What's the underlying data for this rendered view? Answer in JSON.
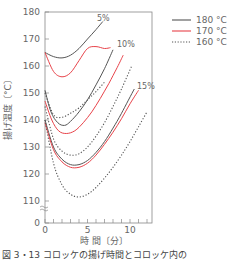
{
  "chart_data": {
    "type": "line",
    "title": "",
    "xlabel": "時 間〔分〕",
    "ylabel": "揚げ温度〔°C〕",
    "xlim": [
      0,
      12.5
    ],
    "ylim": [
      110,
      180
    ],
    "y_axis_break": true,
    "x_ticks": [
      0,
      5,
      10
    ],
    "y_ticks": [
      0,
      110,
      120,
      130,
      140,
      150,
      160,
      170,
      180
    ],
    "grid": false,
    "legend_position": "upper right, outside plot",
    "legend": [
      {
        "label": "180 °C",
        "color": "#555555",
        "style": "solid"
      },
      {
        "label": "170 °C",
        "color": "#e8434a",
        "style": "solid"
      },
      {
        "label": "160 °C",
        "color": "#555555",
        "style": "dotted"
      }
    ],
    "annotations": [
      "5%",
      "10%",
      "15%"
    ],
    "series": [
      {
        "name": "5% 180 °C",
        "group": "5%",
        "temp": "180 °C",
        "style": "solid",
        "color": "#555555",
        "x": [
          0,
          1,
          2,
          3,
          4,
          5,
          6,
          6.8
        ],
        "y": [
          165,
          163.5,
          163,
          164,
          166.5,
          170,
          173.5,
          176.5
        ]
      },
      {
        "name": "5% 170 °C",
        "group": "5%",
        "temp": "170 °C",
        "style": "solid",
        "color": "#e8434a",
        "x": [
          0,
          1,
          2,
          3,
          4,
          5,
          6,
          7,
          7.7
        ],
        "y": [
          165,
          158,
          156,
          157.5,
          162,
          166.5,
          167.2,
          166.5,
          166.8
        ]
      },
      {
        "name": "5% 160 °C",
        "group": "5%",
        "temp": "160 °C",
        "style": "dotted",
        "color": "#555555",
        "x": [
          0,
          1,
          2,
          3,
          4,
          5,
          6,
          7
        ],
        "y": [
          150,
          142,
          141,
          142.5,
          144.5,
          147.5,
          150.5,
          154
        ]
      },
      {
        "name": "10% 180 °C",
        "group": "10%",
        "temp": "180 °C",
        "style": "solid",
        "color": "#555555",
        "x": [
          0,
          0.7,
          1.5,
          2.3,
          3,
          4,
          5,
          6,
          7,
          8
        ],
        "y": [
          151,
          143,
          139,
          138,
          139.5,
          143,
          147.5,
          153,
          159,
          166
        ]
      },
      {
        "name": "10% 170 °C",
        "group": "10%",
        "temp": "170 °C",
        "style": "solid",
        "color": "#e8434a",
        "x": [
          0,
          0.8,
          1.6,
          2.5,
          3.5,
          4.5,
          5.5,
          6.5,
          7.5,
          8.5,
          9.2
        ],
        "y": [
          147,
          140,
          136,
          135,
          136,
          139,
          143,
          148,
          153.5,
          159.5,
          164
        ]
      },
      {
        "name": "10% 160 °C",
        "group": "10%",
        "temp": "160 °C",
        "style": "dotted",
        "color": "#555555",
        "x": [
          0,
          1,
          2,
          3,
          4,
          5,
          6,
          7,
          8,
          9,
          10.2
        ],
        "y": [
          145,
          133,
          128.5,
          127,
          127.5,
          130,
          134,
          139,
          145,
          151.5,
          160
        ]
      },
      {
        "name": "15% 180 °C",
        "group": "15%",
        "temp": "180 °C",
        "style": "solid",
        "color": "#555555",
        "x": [
          0,
          1,
          2,
          3,
          4,
          5,
          6,
          7,
          8,
          9,
          10.5
        ],
        "y": [
          140,
          130,
          125.5,
          123.5,
          123.5,
          125,
          128,
          132,
          137,
          142.5,
          151.5
        ]
      },
      {
        "name": "15% 170 °C",
        "group": "15%",
        "temp": "170 °C",
        "style": "solid",
        "color": "#e8434a",
        "x": [
          0,
          1,
          2,
          3,
          4,
          5,
          6,
          7,
          8,
          9,
          10,
          11
        ],
        "y": [
          139,
          129,
          124.5,
          122.5,
          122.5,
          124,
          127,
          131,
          135.5,
          140.5,
          146,
          151
        ]
      },
      {
        "name": "15% 160 °C",
        "group": "15%",
        "temp": "160 °C",
        "style": "dotted",
        "color": "#555555",
        "x": [
          0,
          1,
          2,
          3,
          4,
          5,
          6,
          7,
          8,
          9,
          10,
          11,
          12
        ],
        "y": [
          140,
          124,
          116,
          112.5,
          111.5,
          112.5,
          115,
          118.5,
          122.5,
          127,
          132,
          137.5,
          143
        ]
      }
    ]
  },
  "labels": {
    "annotation_5": "5%",
    "annotation_10": "10%",
    "annotation_15": "15%",
    "legend_180": "180 °C",
    "legend_170": "170 °C",
    "legend_160": "160 °C",
    "xlabel": "時 間〔分〕",
    "ylabel": "揚げ温度〔°C〕",
    "caption": "図 3・13 コロッケの揚げ時間とコロッケ内の"
  }
}
